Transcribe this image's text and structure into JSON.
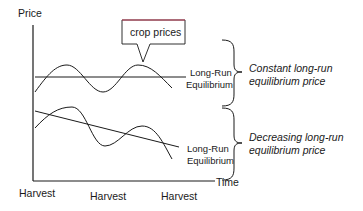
{
  "diagram": {
    "y_axis_label": "Price",
    "x_axis_label": "Time",
    "x_ticks": [
      "Harvest",
      "Harvest",
      "Harvest"
    ],
    "callout": "crop prices",
    "upper_panel": {
      "line_label_1": "Long-Run",
      "line_label_2": "Equilibrium",
      "note_1": "Constant long-run",
      "note_2": "equilibrium price"
    },
    "lower_panel": {
      "line_label_1": "Long-Run",
      "line_label_2": "Equilibrium",
      "note_1": "Decreasing long-run",
      "note_2": "equilibrium price"
    },
    "colors": {
      "stroke": "#1a1a1a",
      "callout_top": "#c0405a"
    }
  }
}
